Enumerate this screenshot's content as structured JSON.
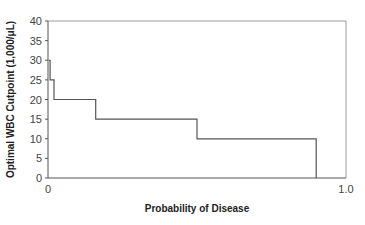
{
  "chart_data": {
    "type": "line",
    "subtype": "step",
    "title": "",
    "xlabel": "Probability of Disease",
    "ylabel": "Optimal WBC Cutpoint (1,000/μL)",
    "xlim": [
      0,
      1.0
    ],
    "ylim": [
      0,
      40
    ],
    "x_tick_labels": [
      "0",
      "1.0"
    ],
    "y_ticks": [
      0,
      5,
      10,
      15,
      20,
      25,
      30,
      35,
      40
    ],
    "grid": false,
    "legend": null,
    "series": [
      {
        "name": "Optimal WBC Cutpoint",
        "color": "#555555",
        "points": [
          {
            "x": 0.003,
            "y": 30
          },
          {
            "x": 0.007,
            "y": 30
          },
          {
            "x": 0.007,
            "y": 25
          },
          {
            "x": 0.02,
            "y": 25
          },
          {
            "x": 0.02,
            "y": 20
          },
          {
            "x": 0.16,
            "y": 20
          },
          {
            "x": 0.16,
            "y": 15
          },
          {
            "x": 0.5,
            "y": 15
          },
          {
            "x": 0.5,
            "y": 10
          },
          {
            "x": 0.9,
            "y": 10
          },
          {
            "x": 0.9,
            "y": 0
          }
        ]
      }
    ]
  },
  "layout": {
    "plot_left": 48,
    "plot_right": 346,
    "plot_top": 21,
    "plot_bottom": 178,
    "line_color": "#555555",
    "frame_color": "#9a9a9a"
  }
}
